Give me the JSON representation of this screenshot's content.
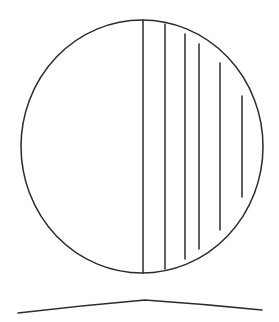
{
  "canvas": {
    "width": 279,
    "height": 322,
    "background_color": "#ffffff",
    "stroke_color": "#2b2b2b",
    "stroke_width": 1.5,
    "figure_name": "circle-with-vertical-chords"
  },
  "circle": {
    "name": "main-circle-outline",
    "center_x": 142,
    "center_y": 146.5,
    "radius_x": 121,
    "radius_y": 126.5,
    "left_edge_x": 21,
    "right_edge_x": 263,
    "top_edge_y": 20,
    "bottom_edge_y": 273,
    "fill": "none"
  },
  "chords": {
    "name": "vertical-chord-lines",
    "count": 6,
    "orientation": "vertical",
    "lines": [
      {
        "id": "chord-1",
        "x": 143,
        "y_top": 20,
        "y_bottom": 273,
        "length": 253
      },
      {
        "id": "chord-2",
        "x": 165,
        "y_top": 24,
        "y_bottom": 269,
        "length": 245
      },
      {
        "id": "chord-3",
        "x": 185,
        "y_top": 34,
        "y_bottom": 259,
        "length": 225
      },
      {
        "id": "chord-4",
        "x": 199,
        "y_top": 44,
        "y_bottom": 249,
        "length": 205
      },
      {
        "id": "chord-5",
        "x": 220,
        "y_top": 63,
        "y_bottom": 230,
        "length": 167
      },
      {
        "id": "chord-6",
        "x": 242,
        "y_top": 96,
        "y_bottom": 197,
        "length": 101
      }
    ]
  },
  "base_curve": {
    "name": "bottom-arc-curve",
    "description": "shallow arc below the circle peaking near center",
    "start_x": 18,
    "start_y": 313,
    "peak_x": 145,
    "peak_y": 300,
    "end_x": 262,
    "end_y": 310
  },
  "chart_data": {
    "type": "line",
    "title": "",
    "xlabel": "",
    "ylabel": "",
    "grid": false,
    "legend": null,
    "series": [
      {
        "name": "circle-outline",
        "kind": "ellipse",
        "cx": 142,
        "cy": 146.5,
        "rx": 121,
        "ry": 126.5
      },
      {
        "name": "vertical-chords",
        "kind": "vertical-segments",
        "x": [
          143,
          165,
          185,
          199,
          220,
          242
        ],
        "y_top": [
          20,
          24,
          34,
          44,
          63,
          96
        ],
        "y_bottom": [
          273,
          269,
          259,
          249,
          230,
          197
        ]
      },
      {
        "name": "base-arc",
        "kind": "polyline",
        "x": [
          18,
          145,
          262
        ],
        "y": [
          313,
          300,
          310
        ]
      }
    ]
  }
}
